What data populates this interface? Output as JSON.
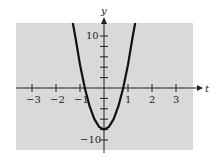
{
  "chart_data": {
    "type": "line",
    "title": "",
    "xlabel": "t",
    "ylabel": "y",
    "xlim": [
      -3.5,
      3.5
    ],
    "ylim": [
      -12,
      12.5
    ],
    "grid": false,
    "background": "#d9d9d9",
    "x_ticks": [
      -3,
      -2,
      -1,
      1,
      2,
      3
    ],
    "x_tick_labels": [
      "−3",
      "−2",
      "−1",
      "1",
      "2",
      "3"
    ],
    "y_ticks": [
      -10,
      -8,
      -6,
      -4,
      -2,
      2,
      4,
      6,
      8,
      10
    ],
    "y_tick_labels_shown": {
      "10": "10",
      "-10": "−10"
    },
    "series": [
      {
        "name": "parabola",
        "description": "upward-opening parabola, vertex near (0, -8), roots near t = ±0.8",
        "x": [
          -1.3,
          -1.2,
          -1.0,
          -0.8,
          -0.6,
          -0.4,
          -0.2,
          0.0,
          0.2,
          0.4,
          0.6,
          0.8,
          1.0,
          1.2,
          1.3
        ],
        "y": [
          13.1,
          10.0,
          4.5,
          0.0,
          -3.5,
          -6.0,
          -7.5,
          -8.0,
          -7.5,
          -6.0,
          -3.5,
          0.0,
          4.5,
          10.0,
          13.1
        ]
      }
    ]
  },
  "labels": {
    "x_axis": "t",
    "y_axis": "y",
    "x_ticks": [
      "−3",
      "−2",
      "−1",
      "1",
      "2",
      "3"
    ],
    "y_top": "10",
    "y_bottom": "−10"
  }
}
